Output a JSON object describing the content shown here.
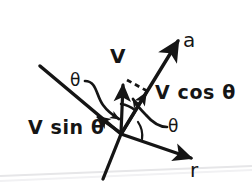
{
  "figure": {
    "kind": "hand-drawn-vector-diagram",
    "background_color": "#ffffff",
    "ink_color": "#151515",
    "page_edge_color": "#e4e4e6"
  },
  "labels": {
    "axis_a": "a",
    "axis_r": "r",
    "vector_v": "V",
    "component_along_a": "V cos θ",
    "component_along_r": "V sin θ",
    "angle_upper": "θ",
    "angle_lower": "θ"
  },
  "geometry": {
    "origin": {
      "x": 121,
      "y": 134
    },
    "axis_a_tip": {
      "x": 181,
      "y": 35
    },
    "axis_r_tip": {
      "x": 196,
      "y": 160
    },
    "transversal_start": {
      "x": 40,
      "y": 66
    },
    "transversal_end": {
      "x": 103,
      "y": 178
    },
    "vector_v_tip": {
      "x": 126,
      "y": 81
    },
    "component_cos_tip": {
      "x": 148,
      "y": 92
    },
    "component_sin_tip": {
      "x": 96,
      "y": 116
    }
  }
}
